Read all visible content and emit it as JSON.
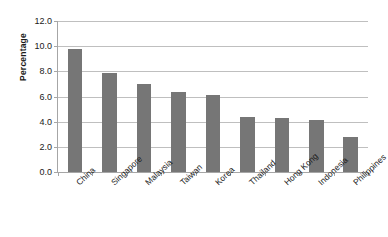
{
  "chart_data": {
    "type": "bar",
    "title": "",
    "xlabel": "",
    "ylabel": "Percentage",
    "categories": [
      "China",
      "Singapore",
      "Malaysia",
      "Taiwan",
      "Korea",
      "Thailand",
      "Hong Kong",
      "Indonesia",
      "Philippines"
    ],
    "values": [
      9.8,
      7.85,
      7.0,
      6.35,
      6.1,
      4.4,
      4.3,
      4.15,
      2.8
    ],
    "ylim": [
      0.0,
      12.0
    ],
    "ytick_values": [
      0.0,
      2.0,
      4.0,
      6.0,
      8.0,
      10.0,
      12.0
    ],
    "ytick_labels": [
      "0.0",
      "2.0",
      "4.0",
      "6.0",
      "8.0",
      "10.0",
      "12.0"
    ],
    "grid": "horizontal",
    "legend": "none",
    "bar_color": "#767676",
    "grid_color": "#bfbfbf",
    "axis_color": "#a6a6a6",
    "background_color": "#ffffff"
  }
}
